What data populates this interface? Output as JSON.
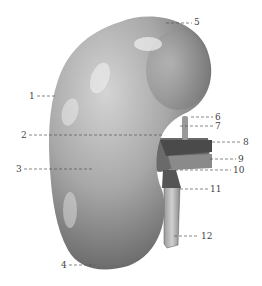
{
  "figure": {
    "labels": [
      {
        "num": "1",
        "x": 29,
        "y": 92,
        "lx1": 37,
        "lx2": 55,
        "ly": 96
      },
      {
        "num": "2",
        "x": 21,
        "y": 131,
        "lx1": 29,
        "lx2": 162,
        "ly": 135
      },
      {
        "num": "3",
        "x": 16,
        "y": 165,
        "lx1": 24,
        "lx2": 92,
        "ly": 169
      },
      {
        "num": "4",
        "x": 61,
        "y": 261,
        "lx1": 69,
        "lx2": 95,
        "ly": 265
      },
      {
        "num": "5",
        "x": 194,
        "y": 18,
        "lx1": 166,
        "lx2": 192,
        "ly": 23
      },
      {
        "num": "6",
        "x": 215,
        "y": 113,
        "lx1": 191,
        "lx2": 213,
        "ly": 117
      },
      {
        "num": "7",
        "x": 215,
        "y": 122,
        "lx1": 180,
        "lx2": 213,
        "ly": 126
      },
      {
        "num": "8",
        "x": 243,
        "y": 138,
        "lx1": 212,
        "lx2": 241,
        "ly": 142
      },
      {
        "num": "9",
        "x": 238,
        "y": 155,
        "lx1": 210,
        "lx2": 236,
        "ly": 159
      },
      {
        "num": "10",
        "x": 233,
        "y": 166,
        "lx1": 170,
        "lx2": 231,
        "ly": 170
      },
      {
        "num": "11",
        "x": 210,
        "y": 185,
        "lx1": 180,
        "lx2": 208,
        "ly": 189
      },
      {
        "num": "12",
        "x": 201,
        "y": 232,
        "lx1": 174,
        "lx2": 199,
        "ly": 236
      }
    ]
  }
}
